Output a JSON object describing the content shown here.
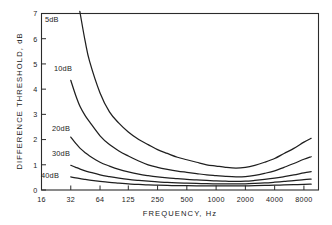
{
  "chart_data": {
    "type": "line",
    "title": "",
    "xlabel": "FREQUENCY, Hz",
    "ylabel": "DIFFERENCE THRESHOLD, dB",
    "x_scale": "log",
    "xtick_labels": [
      "16",
      "32",
      "64",
      "125",
      "250",
      "500",
      "1000",
      "2000",
      "4000",
      "8000"
    ],
    "xtick_values": [
      16,
      32,
      64,
      125,
      250,
      500,
      1000,
      2000,
      4000,
      8000
    ],
    "ytick_labels": [
      "0",
      "1",
      "2",
      "3",
      "4",
      "5",
      "6",
      "7"
    ],
    "ytick_values": [
      0,
      1,
      2,
      3,
      4,
      5,
      6,
      7
    ],
    "ylim": [
      0,
      7
    ],
    "xlim": [
      16,
      11300
    ],
    "grid": false,
    "legend_position": "inline-curve-labels",
    "line_color": "#1f1f1f",
    "series": [
      {
        "name": "5 dB",
        "label": "5dB",
        "label_x": 45,
        "label_y": 22,
        "x": [
          32,
          36,
          40,
          45,
          50,
          64,
          80,
          100,
          125,
          160,
          200,
          250,
          315,
          400,
          500,
          630,
          800,
          1000,
          1250,
          1600,
          2000,
          2500,
          3150,
          4000,
          5000,
          6300,
          8000,
          9500
        ],
        "y": [
          11.0,
          8.6,
          7.0,
          5.9,
          5.1,
          3.85,
          3.1,
          2.65,
          2.3,
          2.0,
          1.8,
          1.6,
          1.45,
          1.3,
          1.2,
          1.1,
          1.0,
          0.95,
          0.9,
          0.87,
          0.9,
          0.98,
          1.1,
          1.25,
          1.45,
          1.65,
          1.9,
          2.05
        ]
      },
      {
        "name": "10 dB",
        "label": "10dB",
        "label_x": 54,
        "label_y": 71,
        "x": [
          32,
          36,
          40,
          45,
          50,
          64,
          80,
          100,
          125,
          160,
          200,
          250,
          315,
          400,
          500,
          630,
          800,
          1000,
          1250,
          1600,
          2000,
          2500,
          3150,
          4000,
          5000,
          6300,
          8000,
          9500
        ],
        "y": [
          4.35,
          3.75,
          3.3,
          2.95,
          2.7,
          2.15,
          1.8,
          1.55,
          1.35,
          1.15,
          1.0,
          0.9,
          0.82,
          0.75,
          0.7,
          0.65,
          0.6,
          0.57,
          0.54,
          0.52,
          0.53,
          0.58,
          0.66,
          0.76,
          0.9,
          1.05,
          1.22,
          1.32
        ]
      },
      {
        "name": "20 dB",
        "label": "20dB",
        "label_x": 52,
        "label_y": 131,
        "x": [
          32,
          36,
          40,
          45,
          50,
          64,
          80,
          100,
          125,
          160,
          200,
          250,
          315,
          400,
          500,
          630,
          800,
          1000,
          1250,
          1600,
          2000,
          2500,
          3150,
          4000,
          5000,
          6300,
          8000,
          9500
        ],
        "y": [
          2.1,
          1.85,
          1.65,
          1.48,
          1.35,
          1.1,
          0.95,
          0.82,
          0.72,
          0.63,
          0.57,
          0.52,
          0.48,
          0.45,
          0.42,
          0.4,
          0.38,
          0.36,
          0.35,
          0.34,
          0.35,
          0.38,
          0.42,
          0.47,
          0.53,
          0.6,
          0.68,
          0.73
        ]
      },
      {
        "name": "30 dB",
        "label": "30dB",
        "label_x": 52,
        "label_y": 156,
        "x": [
          32,
          36,
          40,
          45,
          50,
          64,
          80,
          100,
          125,
          160,
          200,
          250,
          315,
          400,
          500,
          630,
          800,
          1000,
          1250,
          1600,
          2000,
          2500,
          3150,
          4000,
          5000,
          6300,
          8000,
          9500
        ],
        "y": [
          0.98,
          0.9,
          0.83,
          0.76,
          0.71,
          0.6,
          0.53,
          0.47,
          0.42,
          0.38,
          0.35,
          0.32,
          0.3,
          0.28,
          0.27,
          0.26,
          0.25,
          0.245,
          0.24,
          0.24,
          0.245,
          0.26,
          0.28,
          0.31,
          0.34,
          0.37,
          0.41,
          0.43
        ]
      },
      {
        "name": "40 dB",
        "label": "40dB",
        "label_x": 41,
        "label_y": 178,
        "x": [
          32,
          36,
          40,
          45,
          50,
          64,
          80,
          100,
          125,
          160,
          200,
          250,
          315,
          400,
          500,
          630,
          800,
          1000,
          1250,
          1600,
          2000,
          2500,
          3150,
          4000,
          5000,
          6300,
          8000,
          9500
        ],
        "y": [
          0.52,
          0.48,
          0.45,
          0.42,
          0.39,
          0.34,
          0.3,
          0.27,
          0.24,
          0.22,
          0.2,
          0.19,
          0.18,
          0.175,
          0.17,
          0.165,
          0.16,
          0.16,
          0.16,
          0.16,
          0.165,
          0.17,
          0.18,
          0.19,
          0.2,
          0.21,
          0.225,
          0.23
        ]
      }
    ]
  }
}
